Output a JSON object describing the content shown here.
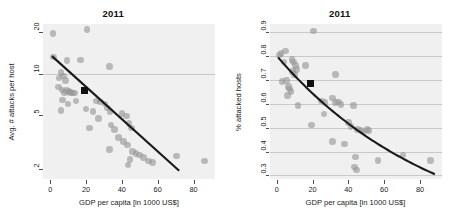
{
  "figure": {
    "panels": [
      "left",
      "right"
    ]
  },
  "chart_data": [
    {
      "type": "scatter",
      "panel": "left",
      "title": "2011",
      "xlabel": "GDP per capita [in 1000 US$]",
      "ylabel": "Avg. # attacks per host",
      "xlim": [
        -4,
        92
      ],
      "ylim": [
        1.7,
        23
      ],
      "yscale": "log",
      "xscale": "linear",
      "xticks": [
        0,
        20,
        40,
        60,
        80
      ],
      "xticklabels": [
        "0",
        "20",
        "40",
        "60",
        "80"
      ],
      "yticks": [
        2,
        5,
        10,
        20
      ],
      "yticklabels": [
        "2",
        "5",
        "10",
        "20"
      ],
      "grid": "horizontal-at-y10",
      "gridlines_y": [
        10
      ],
      "legend": "none",
      "point_color": "#969696",
      "line_color": "#1a1a1a",
      "marker_color": "#111111",
      "points": [
        [
          1.5,
          19.6
        ],
        [
          20.5,
          21.0
        ],
        [
          2.0,
          13.2
        ],
        [
          9.5,
          12.5
        ],
        [
          17.0,
          12.6
        ],
        [
          33.0,
          11.3
        ],
        [
          6.0,
          10.2
        ],
        [
          7.5,
          9.6
        ],
        [
          8.5,
          8.9
        ],
        [
          5.0,
          9.3
        ],
        [
          4.5,
          8.0
        ],
        [
          6.5,
          7.6
        ],
        [
          8.0,
          7.3
        ],
        [
          9.0,
          7.5
        ],
        [
          10.5,
          7.4
        ],
        [
          11.5,
          7.3
        ],
        [
          12.5,
          7.2
        ],
        [
          13.5,
          7.2
        ],
        [
          7.0,
          6.4
        ],
        [
          10.0,
          6.0
        ],
        [
          14.5,
          6.3
        ],
        [
          26.0,
          6.3
        ],
        [
          28.0,
          6.2
        ],
        [
          30.5,
          6.0
        ],
        [
          6.0,
          5.4
        ],
        [
          20.0,
          5.5
        ],
        [
          24.0,
          5.3
        ],
        [
          32.0,
          5.6
        ],
        [
          33.5,
          5.3
        ],
        [
          27.0,
          4.7
        ],
        [
          40.0,
          5.1
        ],
        [
          42.5,
          4.9
        ],
        [
          22.0,
          4.0
        ],
        [
          34.0,
          4.2
        ],
        [
          36.0,
          3.9
        ],
        [
          44.0,
          4.3
        ],
        [
          45.5,
          4.0
        ],
        [
          38.0,
          3.4
        ],
        [
          41.0,
          3.2
        ],
        [
          43.0,
          3.0
        ],
        [
          33.0,
          2.8
        ],
        [
          46.0,
          2.7
        ],
        [
          48.0,
          2.6
        ],
        [
          50.0,
          2.55
        ],
        [
          44.5,
          2.35
        ],
        [
          43.5,
          2.15
        ],
        [
          52.0,
          2.45
        ],
        [
          55.0,
          2.3
        ],
        [
          57.0,
          2.25
        ],
        [
          70.5,
          2.5
        ],
        [
          86.0,
          2.3
        ]
      ],
      "highlight_point": [
        19.0,
        7.5
      ],
      "trend": {
        "kind": "log-linear",
        "x_start": 1.0,
        "x_end": 72.0,
        "y_start": 13.4,
        "y_end": 1.95
      }
    },
    {
      "type": "scatter",
      "panel": "right",
      "title": "2011",
      "xlabel": "GDP per capita [in 1000 US$]",
      "ylabel": "% attacked hosts",
      "xlim": [
        -4,
        92
      ],
      "ylim": [
        0.285,
        0.935
      ],
      "yscale": "linear",
      "xscale": "linear",
      "xticks": [
        0,
        20,
        40,
        60,
        80
      ],
      "xticklabels": [
        "0",
        "20",
        "40",
        "60",
        "80"
      ],
      "yticks": [
        0.3,
        0.4,
        0.5,
        0.6,
        0.7,
        0.8,
        0.9
      ],
      "yticklabels": [
        "0.3",
        "0.4",
        "0.5",
        "0.6",
        "0.7",
        "0.8",
        "0.9"
      ],
      "grid": "horizontal-all-ticks",
      "gridlines_y": [
        0.3,
        0.4,
        0.5,
        0.6,
        0.7,
        0.8,
        0.9
      ],
      "legend": "none",
      "point_color": "#969696",
      "line_color": "#1a1a1a",
      "marker_color": "#111111",
      "points": [
        [
          20.5,
          0.905
        ],
        [
          1.5,
          0.805
        ],
        [
          2.5,
          0.812
        ],
        [
          5.0,
          0.822
        ],
        [
          4.0,
          0.775
        ],
        [
          8.5,
          0.785
        ],
        [
          9.5,
          0.775
        ],
        [
          10.5,
          0.762
        ],
        [
          11.0,
          0.745
        ],
        [
          16.0,
          0.762
        ],
        [
          9.0,
          0.735
        ],
        [
          10.0,
          0.722
        ],
        [
          3.0,
          0.695
        ],
        [
          5.5,
          0.697
        ],
        [
          33.0,
          0.722
        ],
        [
          6.5,
          0.672
        ],
        [
          7.0,
          0.662
        ],
        [
          8.0,
          0.652
        ],
        [
          6.0,
          0.635
        ],
        [
          12.0,
          0.592
        ],
        [
          25.0,
          0.612
        ],
        [
          27.0,
          0.605
        ],
        [
          31.0,
          0.625
        ],
        [
          33.0,
          0.607
        ],
        [
          34.5,
          0.608
        ],
        [
          36.0,
          0.598
        ],
        [
          43.0,
          0.592
        ],
        [
          26.5,
          0.558
        ],
        [
          19.5,
          0.512
        ],
        [
          40.0,
          0.522
        ],
        [
          41.5,
          0.505
        ],
        [
          45.0,
          0.492
        ],
        [
          47.0,
          0.488
        ],
        [
          48.5,
          0.482
        ],
        [
          50.5,
          0.492
        ],
        [
          51.5,
          0.488
        ],
        [
          31.0,
          0.442
        ],
        [
          38.0,
          0.432
        ],
        [
          44.0,
          0.378
        ],
        [
          43.5,
          0.335
        ],
        [
          44.5,
          0.322
        ],
        [
          56.5,
          0.362
        ],
        [
          70.5,
          0.385
        ],
        [
          86.0,
          0.362
        ]
      ],
      "highlight_point": [
        19.0,
        0.685
      ],
      "trend": {
        "kind": "convex-decay",
        "x_start": 0.5,
        "x_end": 88.0,
        "y_start": 0.795,
        "y_end": 0.305
      }
    }
  ]
}
